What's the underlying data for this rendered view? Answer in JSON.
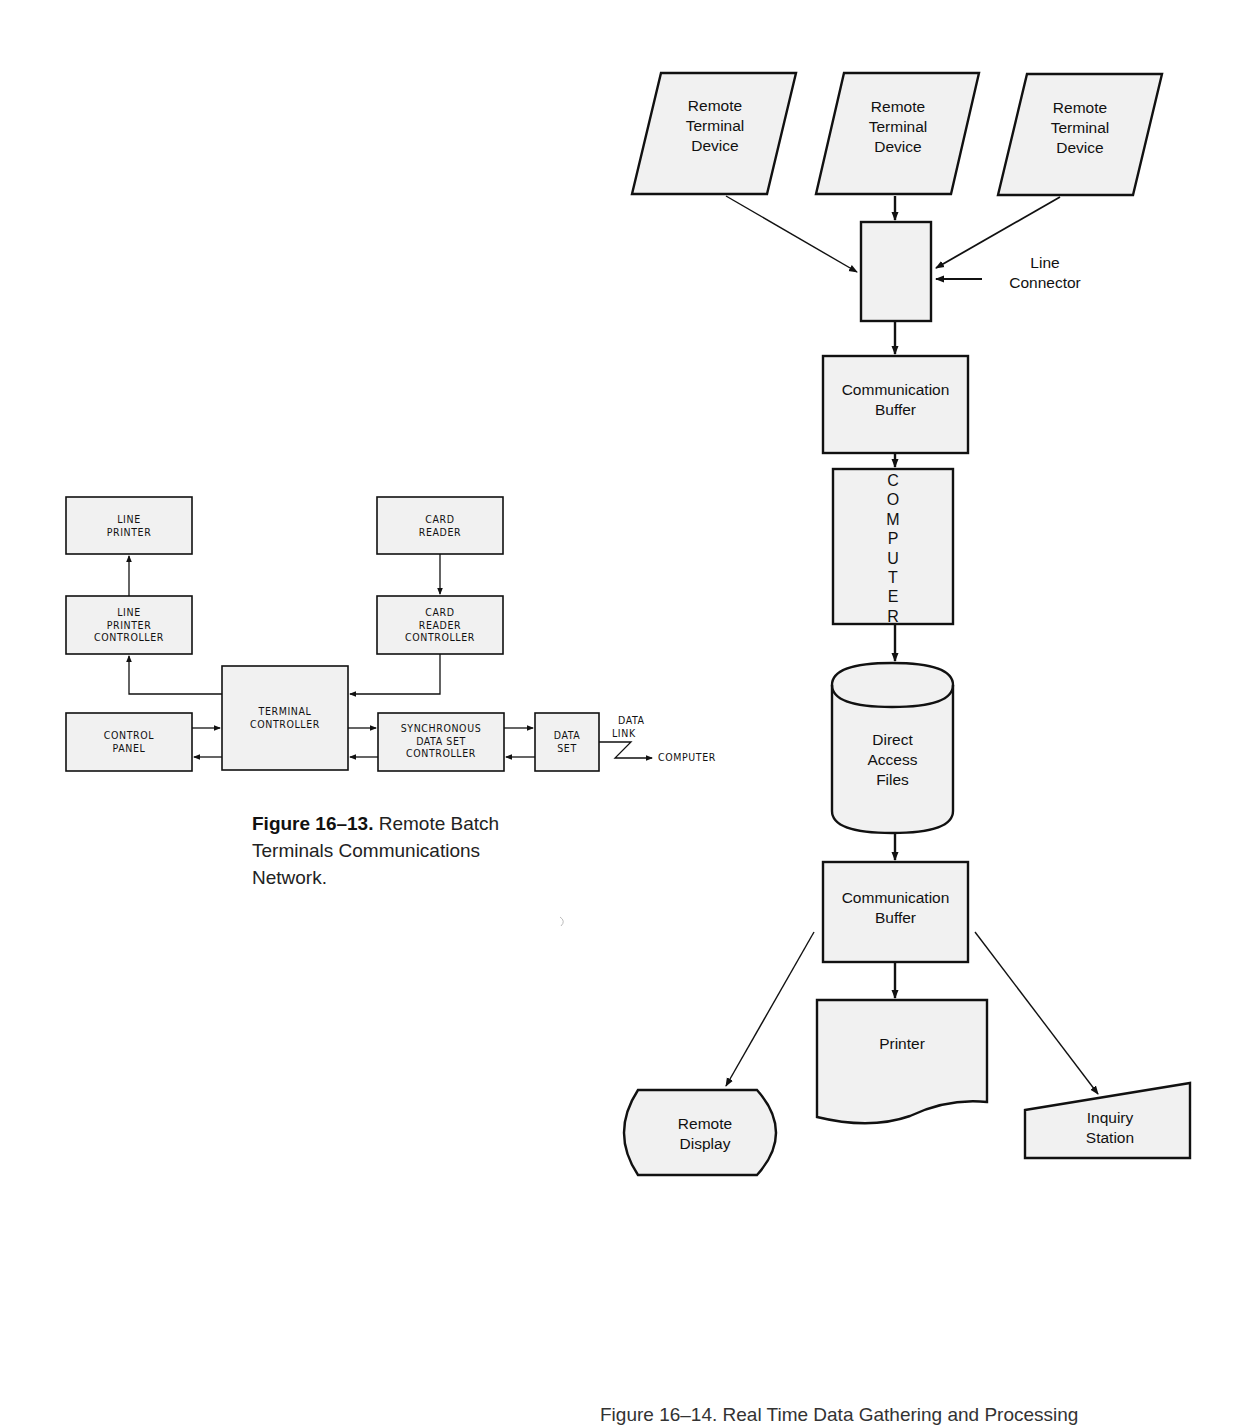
{
  "left_figure": {
    "caption_number": "Figure 16–13.",
    "caption_text_line1": "Remote Batch",
    "caption_text_line2": "Terminals Communications",
    "caption_text_line3": "Network.",
    "blocks": {
      "line_printer": [
        "LINE",
        "PRINTER"
      ],
      "card_reader": [
        "CARD",
        "READER"
      ],
      "line_printer_controller": [
        "LINE",
        "PRINTER",
        "CONTROLLER"
      ],
      "card_reader_controller": [
        "CARD",
        "READER",
        "CONTROLLER"
      ],
      "terminal_controller": [
        "TERMINAL",
        "CONTROLLER"
      ],
      "control_panel": [
        "CONTROL",
        "PANEL"
      ],
      "sync_data_set_controller": [
        "SYNCHRONOUS",
        "DATA SET",
        "CONTROLLER"
      ],
      "data_set": [
        "DATA",
        "SET"
      ]
    },
    "data_link_label": [
      "DATA",
      "LINK"
    ],
    "computer_label": "COMPUTER"
  },
  "right_figure": {
    "remote_terminals": [
      {
        "line1": "Remote",
        "line2": "Terminal",
        "line3": "Device"
      },
      {
        "line1": "Remote",
        "line2": "Terminal",
        "line3": "Device"
      },
      {
        "line1": "Remote",
        "line2": "Terminal",
        "line3": "Device"
      }
    ],
    "line_connector_label": [
      "Line",
      "Connector"
    ],
    "comm_buffer_top": [
      "Communication",
      "Buffer"
    ],
    "computer_letters": [
      "C",
      "O",
      "M",
      "P",
      "U",
      "T",
      "E",
      "R"
    ],
    "direct_access_files": [
      "Direct",
      "Access",
      "Files"
    ],
    "comm_buffer_bottom": [
      "Communication",
      "Buffer"
    ],
    "printer": "Printer",
    "remote_display": [
      "Remote",
      "Display"
    ],
    "inquiry_station": [
      "Inquiry",
      "Station"
    ],
    "caption_partial": "Figure 16–14.  Real Time Data Gathering and Processing"
  },
  "colors": {
    "box_fill": "#f1f1f1",
    "stroke": "#111111",
    "background": "#ffffff"
  }
}
